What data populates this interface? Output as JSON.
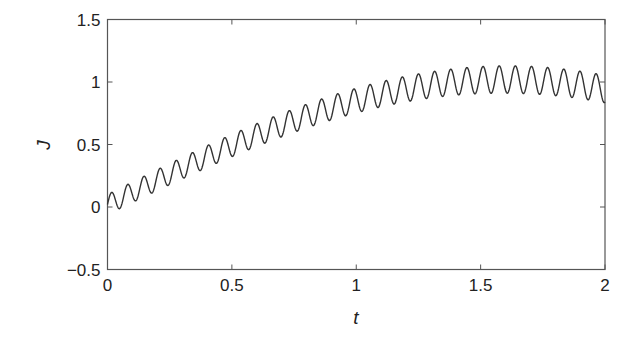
{
  "chart_data": {
    "type": "line",
    "title": "",
    "xlabel": "t",
    "ylabel": "J",
    "xlim": [
      0,
      2
    ],
    "ylim": [
      -0.5,
      1.5
    ],
    "xticks": [
      0,
      0.5,
      1,
      1.5,
      2
    ],
    "xtick_labels": [
      "0",
      "0.5",
      "1",
      "1.5",
      "2"
    ],
    "yticks": [
      -0.5,
      0,
      0.5,
      1,
      1.5
    ],
    "ytick_labels": [
      "−0.5",
      "0",
      "0.5",
      "1",
      "1.5"
    ],
    "grid": false,
    "legend": null,
    "box": true,
    "line_color": "#333333",
    "axis_color": "#555555",
    "series": [
      {
        "name": "J(t)",
        "model": {
          "trend": "sin(pi*t/3.2) + 0.02",
          "oscillation_amplitude": [
            0.08,
            0.11
          ],
          "oscillation_frequency_cycles_per_unit_t": 15.4,
          "phase_rad": 0.0
        },
        "x": [
          0,
          0.016,
          0.048,
          0.25,
          0.5,
          0.75,
          1.0,
          1.25,
          1.5,
          1.6,
          1.75,
          1.964,
          2.0
        ],
        "trend_values": [
          0.02,
          0.04,
          0.07,
          0.26,
          0.49,
          0.7,
          0.85,
          0.96,
          1.01,
          1.02,
          1.01,
          0.95,
          0.94
        ],
        "peak_values_sampled": [
          {
            "t": 0.016,
            "J": 0.11
          },
          {
            "t": 0.5,
            "J": 0.56
          },
          {
            "t": 1.0,
            "J": 0.95
          },
          {
            "t": 1.55,
            "J": 1.1
          },
          {
            "t": 1.964,
            "J": 1.03
          }
        ],
        "trough_values_sampled": [
          {
            "t": 0.048,
            "J": -0.05
          },
          {
            "t": 0.5,
            "J": 0.38
          },
          {
            "t": 1.0,
            "J": 0.76
          },
          {
            "t": 1.6,
            "J": 0.88
          }
        ],
        "end_value": {
          "t": 2.0,
          "J": 0.82
        }
      }
    ]
  }
}
